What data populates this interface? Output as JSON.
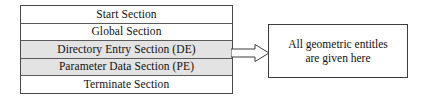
{
  "diagram": {
    "table": {
      "rows": [
        {
          "label": "Start Section",
          "shaded": false
        },
        {
          "label": "Global Section",
          "shaded": false
        },
        {
          "label": "Directory Entry Section (DE)",
          "shaded": true
        },
        {
          "label": "Parameter Data Section (PE)",
          "shaded": true
        },
        {
          "label": "Terminate Section",
          "shaded": false
        }
      ]
    },
    "connector": {
      "icon": "right-block-arrow-icon",
      "direction": "right",
      "style": "hollow-outline"
    },
    "note": {
      "lines": [
        "All geometric entitles",
        "are given here"
      ]
    },
    "colors": {
      "shaded_row_fill": "#e3e3e3",
      "row_fill": "#ffffff",
      "border": "#4a4a4a",
      "text": "#111111",
      "page_background": "#ffffff"
    }
  }
}
